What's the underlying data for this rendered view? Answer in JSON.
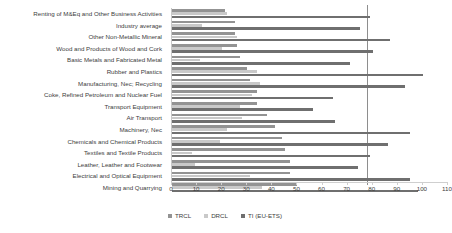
{
  "chart_data": {
    "type": "bar",
    "orientation": "horizontal",
    "title": "",
    "subtitle": "",
    "xlabel": "",
    "ylabel": "",
    "xlim": [
      0,
      110
    ],
    "xticks": [
      0,
      10,
      20,
      30,
      40,
      50,
      60,
      70,
      80,
      90,
      100,
      110
    ],
    "xtick_labels": [
      "0",
      "10",
      "20",
      "30",
      "40",
      "50",
      "60",
      "70",
      "80",
      "90",
      "100",
      "110"
    ],
    "grid": false,
    "legend_position": "bottom",
    "reference_line": {
      "value": 78,
      "label": ""
    },
    "categories": [
      "Renting of M&Eq and Other Business Activities",
      "Industry average",
      "Other Non-Metallic Mineral",
      "Wood and Products of Wood and Cork",
      "Basic Metals and Fabricated Metal",
      "Rubber and Plastics",
      "Manufacturing, Nec; Recycling",
      "Coke, Refined Petroleum and Nuclear Fuel",
      "Transport Equipment",
      "Air Transport",
      "Machinery, Nec",
      "Chemicals and Chemical Products",
      "Textiles and Textile Products",
      "Leather, Leather and Footwear",
      "Electrical and Optical Equipment",
      "Mining and Quarrying"
    ],
    "series": [
      {
        "name": "TRCL",
        "color": "#939393",
        "values": [
          21,
          25,
          25,
          26,
          27,
          30,
          31,
          34,
          34,
          38,
          41,
          44,
          45,
          47,
          47,
          50
        ]
      },
      {
        "name": "DRCL",
        "color": "#c9c9c9",
        "values": [
          22,
          12,
          26,
          20,
          11,
          34,
          35,
          32,
          27,
          28,
          22,
          19,
          8,
          9,
          31,
          36
        ]
      },
      {
        "name": "TI (EU-ETS)",
        "color": "#6f6f6f",
        "values": [
          79,
          75,
          87,
          80,
          71,
          100,
          93,
          64,
          56,
          65,
          95,
          86,
          79,
          74,
          95,
          98
        ]
      }
    ]
  },
  "legend": {
    "items": [
      {
        "label": "TRCL",
        "color": "#939393"
      },
      {
        "label": "DRCL",
        "color": "#c9c9c9"
      },
      {
        "label": "TI (EU-ETS)",
        "color": "#6f6f6f"
      }
    ]
  }
}
